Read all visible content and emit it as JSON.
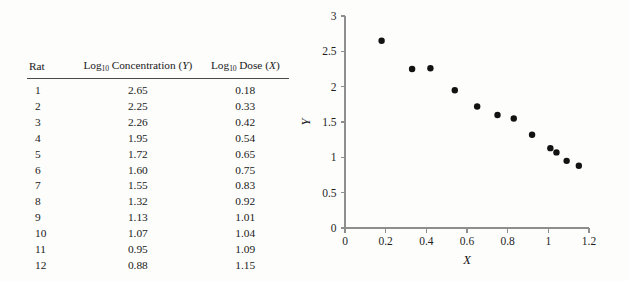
{
  "table": {
    "columns": [
      {
        "key": "rat",
        "label_plain": "Rat",
        "label_html_parts": [
          "Rat"
        ]
      },
      {
        "key": "conc",
        "label_plain": "Log10 Concentration (Y)",
        "prefix": "Log",
        "sub": "10",
        "middle": " Concentration (",
        "symbol": "Y",
        "suffix": ")"
      },
      {
        "key": "dose",
        "label_plain": "Log10 Dose (X)",
        "prefix": "Log",
        "sub": "10",
        "middle": " Dose (",
        "symbol": "X",
        "suffix": ")"
      }
    ],
    "rows": [
      {
        "rat": "1",
        "conc": "2.65",
        "dose": "0.18"
      },
      {
        "rat": "2",
        "conc": "2.25",
        "dose": "0.33"
      },
      {
        "rat": "3",
        "conc": "2.26",
        "dose": "0.42"
      },
      {
        "rat": "4",
        "conc": "1.95",
        "dose": "0.54"
      },
      {
        "rat": "5",
        "conc": "1.72",
        "dose": "0.65"
      },
      {
        "rat": "6",
        "conc": "1.60",
        "dose": "0.75"
      },
      {
        "rat": "7",
        "conc": "1.55",
        "dose": "0.83"
      },
      {
        "rat": "8",
        "conc": "1.32",
        "dose": "0.92"
      },
      {
        "rat": "9",
        "conc": "1.13",
        "dose": "1.01"
      },
      {
        "rat": "10",
        "conc": "1.07",
        "dose": "1.04"
      },
      {
        "rat": "11",
        "conc": "0.95",
        "dose": "1.09"
      },
      {
        "rat": "12",
        "conc": "0.88",
        "dose": "1.15"
      }
    ]
  },
  "chart_data": {
    "type": "scatter",
    "title": "",
    "xlabel": "X",
    "ylabel": "Y",
    "xlim": [
      0,
      1.2
    ],
    "ylim": [
      0,
      3
    ],
    "xticks": [
      0,
      0.2,
      0.4,
      0.6,
      0.8,
      1,
      1.2
    ],
    "xticklabels": [
      "0",
      "0.2",
      "0.4",
      "0.6",
      "0.8",
      "1",
      "1.2"
    ],
    "yticks": [
      0,
      0.5,
      1,
      1.5,
      2,
      2.5,
      3
    ],
    "yticklabels": [
      "0",
      "0.5",
      "1",
      "1.5",
      "2",
      "2.5",
      "3"
    ],
    "grid": false,
    "legend": null,
    "marker": "filled-circle",
    "marker_color": "#121212",
    "marker_size_px": 3.2,
    "x": [
      0.18,
      0.33,
      0.42,
      0.54,
      0.65,
      0.75,
      0.83,
      0.92,
      1.01,
      1.04,
      1.09,
      1.15
    ],
    "y": [
      2.65,
      2.25,
      2.26,
      1.95,
      1.72,
      1.6,
      1.55,
      1.32,
      1.13,
      1.07,
      0.95,
      0.88
    ],
    "points": [
      {
        "x": 0.18,
        "y": 2.65
      },
      {
        "x": 0.33,
        "y": 2.25
      },
      {
        "x": 0.42,
        "y": 2.26
      },
      {
        "x": 0.54,
        "y": 1.95
      },
      {
        "x": 0.65,
        "y": 1.72
      },
      {
        "x": 0.75,
        "y": 1.6
      },
      {
        "x": 0.83,
        "y": 1.55
      },
      {
        "x": 0.92,
        "y": 1.32
      },
      {
        "x": 1.01,
        "y": 1.13
      },
      {
        "x": 1.04,
        "y": 1.07
      },
      {
        "x": 1.09,
        "y": 0.95
      },
      {
        "x": 1.15,
        "y": 0.88
      }
    ]
  },
  "colors": {
    "background": "#fdfdfc",
    "text": "#1a1a1a",
    "axis": "#8e8e8e",
    "marker": "#121212",
    "rule": "#4a4a4a"
  }
}
